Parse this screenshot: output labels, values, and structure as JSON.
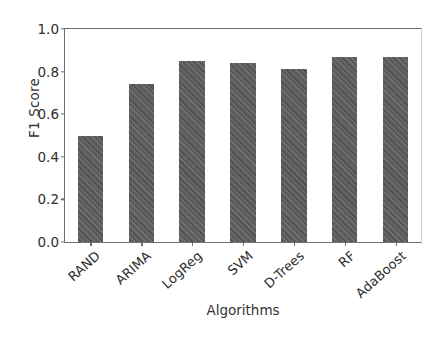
{
  "chart_data": {
    "type": "bar",
    "title": "",
    "xlabel": "Algorithms",
    "ylabel": "F1 Score",
    "categories": [
      "RAND",
      "ARIMA",
      "LogReg",
      "SVM",
      "D-Trees",
      "RF",
      "AdaBoost"
    ],
    "values": [
      0.5,
      0.74,
      0.85,
      0.84,
      0.81,
      0.87,
      0.87
    ],
    "ylim": [
      0.0,
      1.0
    ],
    "xlim_categories": 7,
    "yticks": [
      "0.0",
      "0.2",
      "0.4",
      "0.6",
      "0.8",
      "1.0"
    ],
    "ytick_values": [
      0.0,
      0.2,
      0.4,
      0.6,
      0.8,
      1.0
    ],
    "grid": false,
    "legend": null,
    "bar_color": "#575757",
    "bar_hatch": "diagonal",
    "axis_color": "#6e6e6e",
    "background": "#ffffff",
    "xtick_rotation_deg": -42
  }
}
